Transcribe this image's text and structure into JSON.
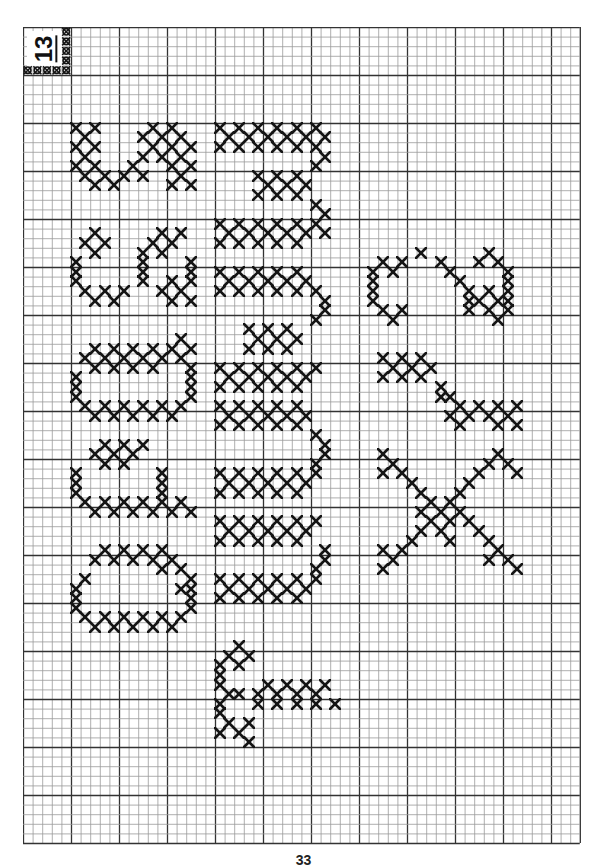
{
  "page": {
    "chart_label": "13",
    "page_number": "33",
    "ink_color": "#151515",
    "grid": {
      "cols": 58,
      "rows": 85,
      "cell_px": 9.6,
      "minor_color": "#9a9a9a",
      "major_color": "#333333",
      "major_every": 5
    },
    "letters": [
      {
        "letter": "O",
        "column": "left"
      },
      {
        "letter": "P",
        "column": "left"
      },
      {
        "letter": "Q",
        "column": "left"
      },
      {
        "letter": "R",
        "column": "left"
      },
      {
        "letter": "S",
        "column": "left"
      },
      {
        "letter": "t",
        "column": "middle"
      },
      {
        "letter": "u",
        "column": "middle"
      },
      {
        "letter": "v",
        "column": "middle"
      },
      {
        "letter": "w",
        "column": "middle"
      },
      {
        "letter": "x",
        "column": "right"
      },
      {
        "letter": "y",
        "column": "right"
      },
      {
        "letter": "z",
        "column": "right"
      }
    ]
  },
  "stitches": {
    "S": [
      [
        10,
        5
      ],
      [
        10,
        7
      ],
      [
        11,
        6
      ],
      [
        12,
        5
      ],
      [
        12,
        7
      ],
      [
        13,
        6
      ],
      [
        14,
        5
      ],
      [
        14,
        7
      ],
      [
        15,
        6
      ],
      [
        15,
        8
      ],
      [
        16,
        7
      ],
      [
        16,
        9
      ],
      [
        15,
        10
      ],
      [
        14,
        11
      ],
      [
        13,
        12
      ],
      [
        12,
        13
      ],
      [
        11,
        14
      ],
      [
        10,
        15
      ],
      [
        11,
        16
      ],
      [
        12,
        17
      ],
      [
        13,
        16
      ],
      [
        14,
        17
      ],
      [
        15,
        16
      ],
      [
        16,
        17
      ],
      [
        10,
        13
      ],
      [
        12,
        15
      ],
      [
        14,
        15
      ],
      [
        16,
        15
      ],
      [
        13,
        14
      ],
      [
        11,
        12
      ],
      [
        15,
        12
      ]
    ],
    "R": [
      [
        21,
        7
      ],
      [
        22,
        6
      ],
      [
        23,
        7
      ],
      [
        22,
        8
      ],
      [
        24,
        5
      ],
      [
        25,
        5
      ],
      [
        26,
        5
      ],
      [
        27,
        6
      ],
      [
        28,
        7
      ],
      [
        27,
        8
      ],
      [
        28,
        9
      ],
      [
        27,
        10
      ],
      [
        22,
        13
      ],
      [
        21,
        14
      ],
      [
        22,
        15
      ],
      [
        21,
        16
      ],
      [
        23,
        14
      ],
      [
        23,
        12
      ],
      [
        24,
        12
      ],
      [
        25,
        12
      ],
      [
        26,
        12
      ],
      [
        25,
        17
      ],
      [
        26,
        17
      ],
      [
        24,
        17
      ],
      [
        27,
        16
      ],
      [
        28,
        17
      ],
      [
        26,
        15
      ],
      [
        27,
        14
      ],
      [
        28,
        15
      ]
    ],
    "Q": [
      [
        33,
        7
      ],
      [
        34,
        6
      ],
      [
        35,
        7
      ],
      [
        34,
        8
      ],
      [
        33,
        9
      ],
      [
        34,
        10
      ],
      [
        35,
        9
      ],
      [
        33,
        11
      ],
      [
        34,
        12
      ],
      [
        35,
        11
      ],
      [
        33,
        13
      ],
      [
        34,
        14
      ],
      [
        35,
        13
      ],
      [
        33,
        15
      ],
      [
        34,
        16
      ],
      [
        36,
        5
      ],
      [
        37,
        5
      ],
      [
        38,
        5
      ],
      [
        39,
        6
      ],
      [
        40,
        7
      ],
      [
        39,
        8
      ],
      [
        40,
        9
      ],
      [
        39,
        10
      ],
      [
        40,
        11
      ],
      [
        39,
        12
      ],
      [
        40,
        13
      ],
      [
        39,
        14
      ],
      [
        40,
        15
      ],
      [
        39,
        16
      ],
      [
        38,
        17
      ],
      [
        37,
        17
      ],
      [
        36,
        17
      ],
      [
        35,
        17
      ],
      [
        32,
        16
      ],
      [
        33,
        17
      ]
    ],
    "P": [
      [
        43,
        8
      ],
      [
        44,
        7
      ],
      [
        45,
        8
      ],
      [
        44,
        9
      ],
      [
        43,
        10
      ],
      [
        45,
        10
      ],
      [
        44,
        11
      ],
      [
        43,
        12
      ],
      [
        46,
        5
      ],
      [
        47,
        5
      ],
      [
        48,
        5
      ],
      [
        49,
        6
      ],
      [
        50,
        7
      ],
      [
        49,
        8
      ],
      [
        50,
        9
      ],
      [
        49,
        10
      ],
      [
        50,
        11
      ],
      [
        49,
        12
      ],
      [
        50,
        13
      ],
      [
        49,
        14
      ],
      [
        50,
        15
      ],
      [
        49,
        16
      ],
      [
        50,
        17
      ],
      [
        46,
        14
      ],
      [
        47,
        14
      ],
      [
        48,
        14
      ]
    ],
    "O": [
      [
        55,
        7
      ],
      [
        54,
        8
      ],
      [
        55,
        9
      ],
      [
        54,
        10
      ],
      [
        55,
        11
      ],
      [
        54,
        12
      ],
      [
        55,
        13
      ],
      [
        54,
        14
      ],
      [
        55,
        15
      ],
      [
        56,
        16
      ],
      [
        57,
        6
      ],
      [
        58,
        5
      ],
      [
        59,
        5
      ],
      [
        60,
        5
      ],
      [
        61,
        6
      ],
      [
        62,
        7
      ],
      [
        61,
        8
      ],
      [
        62,
        9
      ],
      [
        61,
        10
      ],
      [
        62,
        11
      ],
      [
        61,
        12
      ],
      [
        62,
        13
      ],
      [
        61,
        14
      ],
      [
        62,
        15
      ],
      [
        61,
        16
      ],
      [
        60,
        17
      ],
      [
        59,
        17
      ],
      [
        58,
        17
      ],
      [
        57,
        17
      ],
      [
        58,
        16
      ],
      [
        56,
        14
      ]
    ],
    "w": [
      [
        10,
        20
      ],
      [
        10,
        22
      ],
      [
        10,
        24
      ],
      [
        10,
        26
      ],
      [
        10,
        28
      ],
      [
        10,
        30
      ],
      [
        11,
        21
      ],
      [
        11,
        23
      ],
      [
        11,
        25
      ],
      [
        11,
        27
      ],
      [
        11,
        29
      ],
      [
        12,
        20
      ],
      [
        12,
        22
      ],
      [
        12,
        24
      ],
      [
        12,
        26
      ],
      [
        12,
        28
      ],
      [
        12,
        30
      ],
      [
        11,
        31
      ],
      [
        13,
        31
      ],
      [
        14,
        30
      ],
      [
        15,
        24
      ],
      [
        15,
        26
      ],
      [
        15,
        28
      ],
      [
        16,
        25
      ],
      [
        16,
        27
      ],
      [
        16,
        29
      ],
      [
        17,
        24
      ],
      [
        17,
        26
      ],
      [
        17,
        28
      ],
      [
        18,
        30
      ],
      [
        19,
        31
      ],
      [
        20,
        20
      ],
      [
        20,
        22
      ],
      [
        20,
        24
      ],
      [
        20,
        26
      ],
      [
        20,
        28
      ],
      [
        20,
        30
      ],
      [
        21,
        21
      ],
      [
        21,
        23
      ],
      [
        21,
        25
      ],
      [
        21,
        27
      ],
      [
        21,
        29
      ],
      [
        22,
        20
      ],
      [
        22,
        22
      ],
      [
        22,
        24
      ],
      [
        22,
        26
      ],
      [
        22,
        28
      ],
      [
        21,
        31
      ]
    ],
    "v": [
      [
        25,
        20
      ],
      [
        25,
        22
      ],
      [
        25,
        24
      ],
      [
        25,
        26
      ],
      [
        25,
        28
      ],
      [
        26,
        21
      ],
      [
        26,
        23
      ],
      [
        26,
        25
      ],
      [
        26,
        27
      ],
      [
        26,
        29
      ],
      [
        27,
        20
      ],
      [
        27,
        22
      ],
      [
        27,
        24
      ],
      [
        27,
        26
      ],
      [
        27,
        28
      ],
      [
        27,
        30
      ],
      [
        28,
        31
      ],
      [
        29,
        31
      ],
      [
        30,
        30
      ],
      [
        31,
        23
      ],
      [
        31,
        25
      ],
      [
        31,
        27
      ],
      [
        32,
        24
      ],
      [
        32,
        26
      ],
      [
        32,
        28
      ],
      [
        33,
        23
      ],
      [
        33,
        25
      ],
      [
        33,
        27
      ],
      [
        35,
        20
      ],
      [
        35,
        22
      ],
      [
        35,
        24
      ],
      [
        35,
        26
      ],
      [
        35,
        28
      ],
      [
        35,
        30
      ],
      [
        36,
        21
      ],
      [
        36,
        23
      ],
      [
        36,
        25
      ],
      [
        36,
        27
      ],
      [
        36,
        29
      ],
      [
        37,
        20
      ],
      [
        37,
        22
      ],
      [
        37,
        24
      ],
      [
        37,
        26
      ],
      [
        37,
        28
      ]
    ],
    "u": [
      [
        39,
        20
      ],
      [
        39,
        22
      ],
      [
        39,
        24
      ],
      [
        39,
        26
      ],
      [
        39,
        28
      ],
      [
        40,
        21
      ],
      [
        40,
        23
      ],
      [
        40,
        25
      ],
      [
        40,
        27
      ],
      [
        40,
        29
      ],
      [
        41,
        20
      ],
      [
        41,
        22
      ],
      [
        41,
        24
      ],
      [
        41,
        26
      ],
      [
        41,
        28
      ],
      [
        42,
        30
      ],
      [
        43,
        31
      ],
      [
        44,
        31
      ],
      [
        45,
        30
      ],
      [
        46,
        20
      ],
      [
        46,
        22
      ],
      [
        46,
        24
      ],
      [
        46,
        26
      ],
      [
        46,
        28
      ],
      [
        46,
        30
      ],
      [
        47,
        21
      ],
      [
        47,
        23
      ],
      [
        47,
        25
      ],
      [
        47,
        27
      ],
      [
        47,
        29
      ],
      [
        48,
        20
      ],
      [
        48,
        22
      ],
      [
        48,
        24
      ],
      [
        48,
        26
      ],
      [
        48,
        28
      ],
      [
        51,
        20
      ],
      [
        51,
        22
      ],
      [
        51,
        24
      ],
      [
        51,
        26
      ],
      [
        51,
        28
      ],
      [
        51,
        30
      ],
      [
        52,
        21
      ],
      [
        52,
        23
      ],
      [
        52,
        25
      ],
      [
        52,
        27
      ],
      [
        52,
        29
      ],
      [
        53,
        20
      ],
      [
        53,
        22
      ],
      [
        53,
        24
      ],
      [
        53,
        26
      ],
      [
        53,
        28
      ],
      [
        54,
        31
      ],
      [
        55,
        31
      ],
      [
        56,
        30
      ],
      [
        57,
        20
      ],
      [
        57,
        22
      ],
      [
        57,
        24
      ],
      [
        57,
        26
      ],
      [
        57,
        28
      ],
      [
        57,
        30
      ],
      [
        58,
        21
      ],
      [
        58,
        23
      ],
      [
        58,
        25
      ],
      [
        58,
        27
      ],
      [
        58,
        29
      ],
      [
        59,
        20
      ],
      [
        59,
        22
      ],
      [
        59,
        24
      ],
      [
        59,
        26
      ],
      [
        59,
        28
      ]
    ],
    "t": [
      [
        64,
        22
      ],
      [
        65,
        21
      ],
      [
        66,
        22
      ],
      [
        65,
        23
      ],
      [
        66,
        20
      ],
      [
        67,
        20
      ],
      [
        68,
        20
      ],
      [
        69,
        21
      ],
      [
        70,
        20
      ],
      [
        69,
        22
      ],
      [
        70,
        24
      ],
      [
        69,
        24
      ],
      [
        70,
        26
      ],
      [
        69,
        26
      ],
      [
        68,
        25
      ],
      [
        68,
        27
      ],
      [
        68,
        29
      ],
      [
        68,
        31
      ],
      [
        69,
        28
      ],
      [
        69,
        30
      ],
      [
        70,
        28
      ],
      [
        70,
        30
      ],
      [
        70,
        32
      ],
      [
        71,
        20
      ],
      [
        72,
        21
      ],
      [
        73,
        22
      ],
      [
        72,
        23
      ],
      [
        74,
        23
      ],
      [
        73,
        20
      ]
    ],
    "z": [
      [
        24,
        37
      ],
      [
        25,
        36
      ],
      [
        26,
        36
      ],
      [
        27,
        36
      ],
      [
        28,
        36
      ],
      [
        29,
        37
      ],
      [
        30,
        38
      ],
      [
        29,
        39
      ],
      [
        25,
        38
      ],
      [
        24,
        39
      ],
      [
        23,
        41
      ],
      [
        24,
        43
      ],
      [
        25,
        44
      ],
      [
        26,
        45
      ],
      [
        27,
        46
      ],
      [
        28,
        47
      ],
      [
        29,
        48
      ],
      [
        28,
        49
      ],
      [
        27,
        48
      ],
      [
        28,
        46
      ],
      [
        24,
        47
      ],
      [
        23,
        48
      ],
      [
        24,
        49
      ],
      [
        25,
        50
      ],
      [
        26,
        50
      ],
      [
        27,
        50
      ],
      [
        28,
        50
      ],
      [
        29,
        50
      ],
      [
        30,
        49
      ],
      [
        29,
        46
      ]
    ],
    "y": [
      [
        34,
        37
      ],
      [
        34,
        39
      ],
      [
        34,
        41
      ],
      [
        35,
        38
      ],
      [
        35,
        40
      ],
      [
        35,
        42
      ],
      [
        36,
        37
      ],
      [
        36,
        39
      ],
      [
        36,
        41
      ],
      [
        37,
        43
      ],
      [
        38,
        44
      ],
      [
        39,
        45
      ],
      [
        40,
        44
      ],
      [
        41,
        45
      ],
      [
        39,
        47
      ],
      [
        39,
        49
      ],
      [
        40,
        46
      ],
      [
        40,
        48
      ],
      [
        39,
        51
      ],
      [
        41,
        49
      ],
      [
        41,
        51
      ],
      [
        38,
        43
      ],
      [
        40,
        50
      ]
    ],
    "x": [
      [
        44,
        37
      ],
      [
        45,
        38
      ],
      [
        46,
        37
      ],
      [
        46,
        39
      ],
      [
        47,
        40
      ],
      [
        48,
        41
      ],
      [
        49,
        42
      ],
      [
        49,
        44
      ],
      [
        50,
        43
      ],
      [
        50,
        45
      ],
      [
        51,
        44
      ],
      [
        52,
        41
      ],
      [
        52,
        43
      ],
      [
        51,
        46
      ],
      [
        52,
        47
      ],
      [
        53,
        48
      ],
      [
        54,
        49
      ],
      [
        55,
        50
      ],
      [
        55,
        48
      ],
      [
        56,
        51
      ],
      [
        53,
        40
      ],
      [
        54,
        39
      ],
      [
        55,
        38
      ],
      [
        56,
        37
      ],
      [
        54,
        37
      ],
      [
        47,
        46
      ],
      [
        46,
        47
      ],
      [
        45,
        48
      ],
      [
        44,
        49
      ],
      [
        45,
        50
      ],
      [
        46,
        51
      ],
      [
        48,
        45
      ],
      [
        50,
        41
      ],
      [
        53,
        44
      ],
      [
        51,
        42
      ]
    ]
  }
}
